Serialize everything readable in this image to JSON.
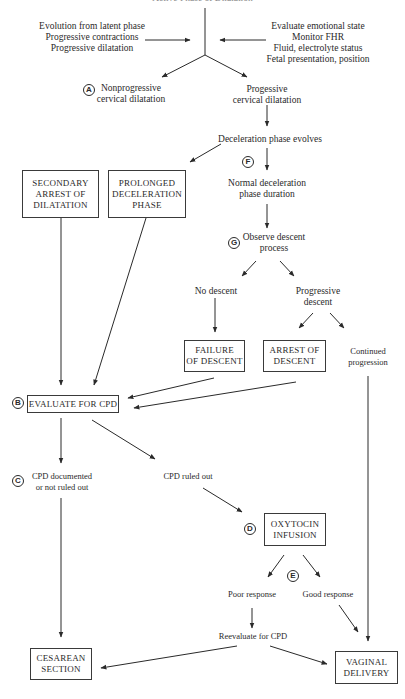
{
  "diagram": {
    "title_partial": "Active Phase of Dilatation",
    "left_inputs": [
      "Evolution from latent phase",
      "Progressive contractions",
      "Progressive dilatation"
    ],
    "right_inputs": [
      "Evaluate emotional state",
      "Monitor FHR",
      "Fluid, electrolyte status",
      "Fetal presentation, position"
    ],
    "nodes": {
      "nonprogressive": "Nonprogressive\ncervical dilatation",
      "progressive": "Progessive\ncervical dilatation",
      "decel_evolves": "Deceleration phase evolves",
      "secondary_arrest": "SECONDARY\nARREST OF\nDILATATION",
      "prolonged_decel": "PROLONGED\nDECELERATION\nPHASE",
      "normal_decel": "Normal deceleration\nphase duration",
      "observe_descent": "Observe descent\nprocess",
      "no_descent": "No descent",
      "progressive_descent": "Progressive\ndescent",
      "failure_descent": "FAILURE\nOF DESCENT",
      "arrest_descent": "ARREST OF\nDESCENT",
      "continued": "Continued\nprogression",
      "evaluate_cpd": "EVALUATE FOR CPD",
      "cpd_documented": "CPD documented\nor not ruled out",
      "cpd_ruled_out": "CPD ruled out",
      "oxytocin": "OXYTOCIN\nINFUSION",
      "poor_response": "Poor response",
      "good_response": "Good response",
      "reevaluate": "Reevaluate for CPD",
      "cesarean": "CESAREAN\nSECTION",
      "vaginal": "VAGINAL\nDELIVERY"
    },
    "markers": {
      "A": "A",
      "B": "B",
      "C": "C",
      "D": "D",
      "E": "E",
      "F": "F",
      "G": "G"
    },
    "colors": {
      "line": "#2a2a2a",
      "text": "#2a2a2a",
      "background": "#ffffff"
    }
  }
}
